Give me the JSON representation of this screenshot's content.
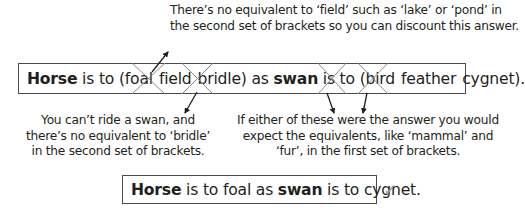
{
  "annotations": {
    "top": {
      "lines": [
        "There’s no equivalent to ‘field’ such as ‘lake’ or ‘pond’ in",
        "the second set of brackets so you can discount this answer."
      ]
    },
    "left": {
      "lines": [
        "You can’t ride a swan, and",
        "there’s no equivalent to ‘bridle’",
        "in the second set of brackets."
      ]
    },
    "right": {
      "lines": [
        "If either of these were the answer you would",
        "expect the equivalents, like ‘mammal’ and",
        "‘fur’, in the first set of brackets."
      ]
    }
  },
  "question": {
    "word1": "Horse",
    "mid1": " is to (foal",
    "opt_field": "field",
    "opt_bridle": "bridle",
    "mid2": ") as ",
    "word2": "swan",
    "mid3": " is to (",
    "opt_bird": "bird",
    "opt_feather": "feather",
    "opt_cygnet": "cygnet",
    "end": ")."
  },
  "answer": {
    "word1": "Horse",
    "mid1": " is to foal as ",
    "word2": "swan",
    "mid2": " is to cygnet.",
    "check_icon": "✓",
    "check_color": "#9aa39a"
  },
  "colors": {
    "text": "#231f20",
    "cross": "#8c8c8c",
    "border": "#4a4a4a"
  }
}
